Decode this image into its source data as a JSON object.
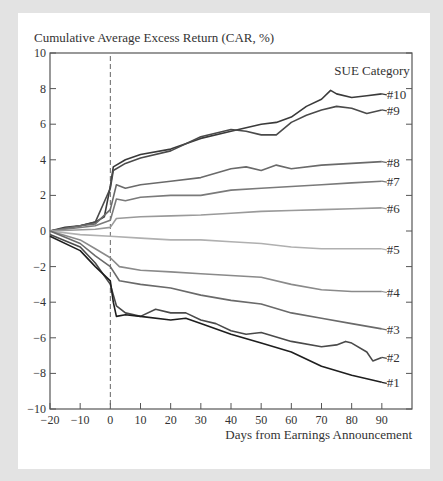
{
  "chart_data": {
    "type": "line",
    "title": "",
    "ylabel": "Cumulative Average Excess Return (CAR, %)",
    "xlabel": "Days from Earnings Announcement",
    "xlim": [
      -20,
      100
    ],
    "ylim": [
      -10,
      10
    ],
    "x_ticks": [
      -20,
      -10,
      0,
      10,
      20,
      30,
      40,
      50,
      60,
      70,
      80,
      90
    ],
    "y_ticks": [
      -10,
      -8,
      -6,
      -4,
      -2,
      0,
      2,
      4,
      6,
      8,
      10
    ],
    "grid": false,
    "legend_title": "SUE Category",
    "legend_position": "right, inline labels at line ends",
    "annotations": [
      "vertical dashed line at day 0"
    ],
    "series": [
      {
        "name": "#10",
        "color": "#3a3a3a",
        "x": [
          -20,
          -15,
          -10,
          -5,
          -2,
          0,
          1,
          5,
          10,
          20,
          30,
          40,
          50,
          55,
          60,
          65,
          70,
          73,
          75,
          80,
          85,
          90
        ],
        "values": [
          0,
          0.2,
          0.3,
          0.5,
          0.8,
          2.5,
          3.6,
          4.0,
          4.3,
          4.6,
          5.2,
          5.6,
          6.0,
          6.1,
          6.4,
          7.0,
          7.4,
          7.9,
          7.7,
          7.5,
          7.6,
          7.7
        ]
      },
      {
        "name": "#9",
        "color": "#4a4a4a",
        "x": [
          -20,
          -10,
          -5,
          0,
          1,
          5,
          10,
          20,
          30,
          40,
          45,
          50,
          55,
          60,
          65,
          70,
          75,
          80,
          85,
          90
        ],
        "values": [
          0,
          0.3,
          0.5,
          2.4,
          3.4,
          3.8,
          4.1,
          4.5,
          5.3,
          5.7,
          5.6,
          5.4,
          5.4,
          6.1,
          6.5,
          6.8,
          7.0,
          6.9,
          6.6,
          6.8
        ]
      },
      {
        "name": "#8",
        "color": "#6a6a6a",
        "x": [
          -20,
          -10,
          -5,
          0,
          2,
          5,
          10,
          20,
          30,
          40,
          45,
          50,
          55,
          60,
          70,
          80,
          90
        ],
        "values": [
          0,
          0.3,
          0.4,
          1.2,
          2.6,
          2.4,
          2.6,
          2.8,
          3.0,
          3.5,
          3.6,
          3.4,
          3.7,
          3.5,
          3.7,
          3.8,
          3.9
        ]
      },
      {
        "name": "#7",
        "color": "#7a7a7a",
        "x": [
          -20,
          -5,
          0,
          2,
          5,
          10,
          20,
          30,
          40,
          50,
          60,
          70,
          80,
          90
        ],
        "values": [
          0,
          0.3,
          0.6,
          1.8,
          1.7,
          1.9,
          2.0,
          2.0,
          2.3,
          2.4,
          2.5,
          2.6,
          2.7,
          2.8
        ]
      },
      {
        "name": "#6",
        "color": "#9a9a9a",
        "x": [
          -20,
          -5,
          0,
          2,
          10,
          20,
          30,
          40,
          50,
          60,
          70,
          80,
          90
        ],
        "values": [
          0,
          0.1,
          0.2,
          0.7,
          0.8,
          0.85,
          0.9,
          1.0,
          1.1,
          1.15,
          1.2,
          1.25,
          1.3
        ]
      },
      {
        "name": "#5",
        "color": "#b0b0b0",
        "x": [
          -20,
          -10,
          0,
          10,
          20,
          30,
          40,
          50,
          60,
          70,
          80,
          90
        ],
        "values": [
          0,
          -0.2,
          -0.3,
          -0.4,
          -0.5,
          -0.5,
          -0.6,
          -0.7,
          -0.9,
          -1.0,
          -1.0,
          -1.0
        ]
      },
      {
        "name": "#4",
        "color": "#8a8a8a",
        "x": [
          -20,
          -10,
          -5,
          0,
          3,
          10,
          20,
          30,
          40,
          50,
          60,
          70,
          80,
          90
        ],
        "values": [
          0,
          -0.5,
          -1.0,
          -1.5,
          -2.0,
          -2.2,
          -2.3,
          -2.4,
          -2.5,
          -2.6,
          -3.0,
          -3.3,
          -3.4,
          -3.4
        ]
      },
      {
        "name": "#3",
        "color": "#6a6a6a",
        "x": [
          -20,
          -10,
          -5,
          0,
          3,
          10,
          20,
          30,
          40,
          50,
          60,
          70,
          80,
          90
        ],
        "values": [
          0,
          -0.7,
          -1.4,
          -2.0,
          -2.8,
          -3.0,
          -3.2,
          -3.6,
          -3.9,
          -4.1,
          -4.6,
          -4.9,
          -5.2,
          -5.5
        ]
      },
      {
        "name": "#2",
        "color": "#4a4a4a",
        "x": [
          -20,
          -10,
          -5,
          0,
          2,
          5,
          10,
          15,
          20,
          25,
          30,
          35,
          40,
          45,
          50,
          60,
          70,
          75,
          78,
          80,
          85,
          87,
          90
        ],
        "values": [
          -0.2,
          -0.9,
          -1.8,
          -3.0,
          -4.2,
          -4.6,
          -4.8,
          -4.4,
          -4.6,
          -4.6,
          -5.0,
          -5.2,
          -5.6,
          -5.8,
          -5.7,
          -6.2,
          -6.5,
          -6.4,
          -6.2,
          -6.3,
          -6.8,
          -7.3,
          -7.1
        ]
      },
      {
        "name": "#1",
        "color": "#1e1e1e",
        "x": [
          -20,
          -10,
          -5,
          0,
          1,
          2,
          5,
          10,
          20,
          25,
          30,
          40,
          50,
          60,
          70,
          80,
          85,
          90
        ],
        "values": [
          -0.3,
          -1.1,
          -2.0,
          -2.8,
          -4.0,
          -4.8,
          -4.7,
          -4.8,
          -5.0,
          -4.9,
          -5.2,
          -5.8,
          -6.3,
          -6.8,
          -7.6,
          -8.1,
          -8.3,
          -8.5
        ]
      }
    ]
  }
}
